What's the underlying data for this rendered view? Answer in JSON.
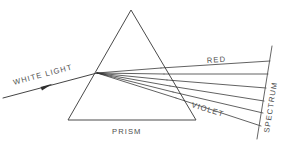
{
  "diagram": {
    "background_color": "#ffffff",
    "line_color": "#3a3a3a",
    "label_color": "#4d4d4d",
    "labels": {
      "white_light": "WHITE LIGHT",
      "prism": "PRISM",
      "red": "RED",
      "violet": "VIOLET",
      "spectrum": "SPECTRUM"
    },
    "prism": {
      "apex": {
        "x": 131,
        "y": 10
      },
      "bottom_left": {
        "x": 68,
        "y": 120
      },
      "bottom_right": {
        "x": 196,
        "y": 120
      }
    },
    "incident_ray": {
      "start": {
        "x": 3,
        "y": 98
      },
      "end": {
        "x": 97,
        "y": 73
      },
      "arrow_at": {
        "x": 46,
        "y": 86
      }
    },
    "refraction_point": {
      "x": 97,
      "y": 73
    },
    "screen": {
      "top": {
        "x": 272,
        "y": 46
      },
      "bottom": {
        "x": 257,
        "y": 139
      }
    },
    "rays": [
      {
        "name": "red",
        "exit_face": {
          "x": 161,
          "y": 68
        },
        "screen": {
          "x": 270,
          "y": 61
        }
      },
      {
        "name": "orange",
        "exit_face": {
          "x": 164,
          "y": 74
        },
        "screen": {
          "x": 268,
          "y": 74
        }
      },
      {
        "name": "yellow",
        "exit_face": {
          "x": 167,
          "y": 80
        },
        "screen": {
          "x": 266,
          "y": 88
        }
      },
      {
        "name": "green",
        "exit_face": {
          "x": 170,
          "y": 86
        },
        "screen": {
          "x": 264,
          "y": 101
        }
      },
      {
        "name": "blue",
        "exit_face": {
          "x": 173,
          "y": 92
        },
        "screen": {
          "x": 263,
          "y": 113
        }
      },
      {
        "name": "violet",
        "exit_face": {
          "x": 176,
          "y": 98
        },
        "screen": {
          "x": 261,
          "y": 126
        }
      }
    ]
  }
}
